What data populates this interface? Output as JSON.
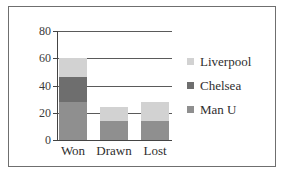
{
  "chart_data": {
    "type": "bar",
    "subtype": "stacked-bar",
    "title": "",
    "xlabel": "",
    "ylabel": "",
    "categories": [
      "Won",
      "Drawn",
      "Lost"
    ],
    "series": [
      {
        "name": "Man U",
        "values": [
          28,
          14,
          14
        ],
        "color": "#8f8f8f"
      },
      {
        "name": "Chelsea",
        "values": [
          18,
          0,
          0
        ],
        "color": "#6e6e6e"
      },
      {
        "name": "Liverpool",
        "values": [
          14,
          10,
          14
        ],
        "color": "#d2d2d2"
      }
    ],
    "totals": [
      60,
      24,
      28
    ],
    "ylim": [
      0,
      80
    ],
    "yticks": [
      0,
      20,
      40,
      60,
      80
    ],
    "ytick_labels": [
      "0",
      "20",
      "40",
      "60",
      "80"
    ],
    "grid": true,
    "grid_axis": "y",
    "legend_position": "right",
    "legend_order": [
      "Liverpool",
      "Chelsea",
      "Man U"
    ]
  },
  "axes": {
    "y_ticks": [
      {
        "label": "80",
        "value": 80
      },
      {
        "label": "60",
        "value": 60
      },
      {
        "label": "40",
        "value": 40
      },
      {
        "label": "20",
        "value": 20
      },
      {
        "label": "0",
        "value": 0
      }
    ],
    "x_ticks": [
      {
        "label": "Won"
      },
      {
        "label": "Drawn"
      },
      {
        "label": "Lost"
      }
    ]
  },
  "legend": {
    "items": [
      {
        "label": "Liverpool",
        "color": "#d2d2d2"
      },
      {
        "label": "Chelsea",
        "color": "#6e6e6e"
      },
      {
        "label": "Man U",
        "color": "#8f8f8f"
      }
    ]
  },
  "colors": {
    "frame": "#6f6f6f",
    "axis": "#444444",
    "gridline": "#5a5a5a",
    "background": "#ffffff",
    "text": "#2e2e2e"
  }
}
